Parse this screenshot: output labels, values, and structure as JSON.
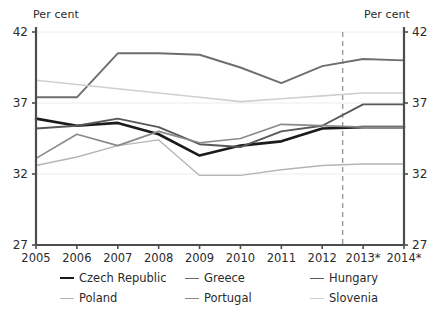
{
  "axis_unit_left": "Per cent",
  "axis_unit_right": "Per cent",
  "legend": {
    "columns": [
      [
        {
          "label": "Czech Republic",
          "color": "#1a1a1a",
          "width": 2.6
        },
        {
          "label": "Poland",
          "color": "#b5b5b5",
          "width": 1.4
        }
      ],
      [
        {
          "label": "Greece",
          "color": "#6e6e6e",
          "width": 1.9
        },
        {
          "label": "Portugal",
          "color": "#8a8a8a",
          "width": 1.7
        }
      ],
      [
        {
          "label": "Hungary",
          "color": "#585858",
          "width": 1.9
        },
        {
          "label": "Slovenia",
          "color": "#cfcfcf",
          "width": 1.6
        }
      ]
    ]
  },
  "chart_data": {
    "type": "line",
    "title": "",
    "xlabel": "",
    "ylabel": "Per cent",
    "ylim": [
      27,
      42
    ],
    "yticks": [
      27,
      32,
      37,
      42
    ],
    "ytick_labels": [
      "27",
      "32",
      "37",
      "42"
    ],
    "grid": true,
    "legend_position": "bottom",
    "dual_axis": true,
    "x": [
      2005,
      2006,
      2007,
      2008,
      2009,
      2010,
      2011,
      2012,
      2013,
      2014
    ],
    "categories": [
      "2005",
      "2006",
      "2007",
      "2008",
      "2009",
      "2010",
      "2011",
      "2012",
      "2013*",
      "2014*"
    ],
    "forecast_divider_after": "2012",
    "forecast_divider_x": 2012.5,
    "annotations": [
      {
        "text": "* forecast years marked with asterisk",
        "type": "footnote-implied"
      }
    ],
    "series": [
      {
        "name": "Czech Republic",
        "color": "#1a1a1a",
        "width": 2.6,
        "values": [
          35.9,
          35.4,
          35.6,
          34.8,
          33.3,
          34.0,
          34.3,
          35.2,
          35.3,
          35.3
        ]
      },
      {
        "name": "Greece",
        "color": "#6e6e6e",
        "width": 1.9,
        "values": [
          37.4,
          37.4,
          40.5,
          40.5,
          40.4,
          39.5,
          38.4,
          39.6,
          40.1,
          40.0
        ]
      },
      {
        "name": "Hungary",
        "color": "#585858",
        "width": 1.9,
        "values": [
          35.2,
          35.4,
          35.9,
          35.3,
          34.1,
          33.9,
          35.0,
          35.4,
          36.9,
          36.9
        ]
      },
      {
        "name": "Poland",
        "color": "#b5b5b5",
        "width": 1.4,
        "values": [
          32.6,
          33.2,
          34.0,
          34.4,
          31.9,
          31.9,
          32.3,
          32.6,
          32.7,
          32.7
        ]
      },
      {
        "name": "Portugal",
        "color": "#8a8a8a",
        "width": 1.7,
        "values": [
          33.1,
          34.8,
          34.0,
          35.0,
          34.2,
          34.5,
          35.5,
          35.4,
          35.3,
          35.3
        ]
      },
      {
        "name": "Slovenia",
        "color": "#cfcfcf",
        "width": 1.6,
        "values": [
          38.6,
          38.3,
          38.0,
          37.7,
          37.4,
          37.1,
          37.3,
          37.5,
          37.7,
          37.7
        ]
      }
    ]
  }
}
